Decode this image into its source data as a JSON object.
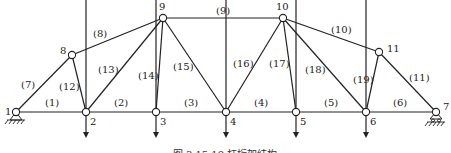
{
  "figure": {
    "caption": "图 3.15   19 杆桁架结构",
    "nodes": [
      {
        "id": "1",
        "x": 16,
        "y": 112,
        "lx": 5,
        "ly": 115
      },
      {
        "id": "2",
        "x": 86,
        "y": 112,
        "lx": 90,
        "ly": 125
      },
      {
        "id": "3",
        "x": 156,
        "y": 112,
        "lx": 160,
        "ly": 125
      },
      {
        "id": "4",
        "x": 226,
        "y": 112,
        "lx": 230,
        "ly": 125
      },
      {
        "id": "5",
        "x": 296,
        "y": 112,
        "lx": 300,
        "ly": 125
      },
      {
        "id": "6",
        "x": 366,
        "y": 112,
        "lx": 370,
        "ly": 125
      },
      {
        "id": "7",
        "x": 436,
        "y": 112,
        "lx": 443,
        "ly": 110
      },
      {
        "id": "8",
        "x": 72,
        "y": 55,
        "lx": 60,
        "ly": 54
      },
      {
        "id": "9",
        "x": 163,
        "y": 18,
        "lx": 159,
        "ly": 10
      },
      {
        "id": "10",
        "x": 283,
        "y": 18,
        "lx": 276,
        "ly": 10
      },
      {
        "id": "11",
        "x": 379,
        "y": 52,
        "lx": 387,
        "ly": 52
      }
    ],
    "members": [
      {
        "id": "(1)",
        "a": "1",
        "b": "2",
        "lx": 45,
        "ly": 106
      },
      {
        "id": "(2)",
        "a": "2",
        "b": "3",
        "lx": 114,
        "ly": 106
      },
      {
        "id": "(3)",
        "a": "3",
        "b": "4",
        "lx": 184,
        "ly": 106
      },
      {
        "id": "(4)",
        "a": "4",
        "b": "5",
        "lx": 254,
        "ly": 106
      },
      {
        "id": "(5)",
        "a": "5",
        "b": "6",
        "lx": 324,
        "ly": 106
      },
      {
        "id": "(6)",
        "a": "6",
        "b": "7",
        "lx": 393,
        "ly": 106
      },
      {
        "id": "(7)",
        "a": "1",
        "b": "8",
        "lx": 21,
        "ly": 88
      },
      {
        "id": "(8)",
        "a": "8",
        "b": "9",
        "lx": 93,
        "ly": 37
      },
      {
        "id": "(9)",
        "a": "9",
        "b": "10",
        "lx": 216,
        "ly": 14
      },
      {
        "id": "(10)",
        "a": "10",
        "b": "11",
        "lx": 331,
        "ly": 33
      },
      {
        "id": "(11)",
        "a": "11",
        "b": "7",
        "lx": 409,
        "ly": 81
      },
      {
        "id": "(12)",
        "a": "8",
        "b": "2",
        "lx": 59,
        "ly": 90
      },
      {
        "id": "(13)",
        "a": "9",
        "b": "2",
        "lx": 98,
        "ly": 73
      },
      {
        "id": "(14)",
        "a": "9",
        "b": "3",
        "lx": 138,
        "ly": 79
      },
      {
        "id": "(15)",
        "a": "9",
        "b": "4",
        "lx": 173,
        "ly": 70
      },
      {
        "id": "(16)",
        "a": "10",
        "b": "4",
        "lx": 233,
        "ly": 67
      },
      {
        "id": "(17)",
        "a": "10",
        "b": "5",
        "lx": 269,
        "ly": 67
      },
      {
        "id": "(18)",
        "a": "10",
        "b": "6",
        "lx": 305,
        "ly": 73
      },
      {
        "id": "(19)",
        "a": "6",
        "b": "11",
        "lx": 353,
        "ly": 83
      }
    ],
    "loads": [
      {
        "node": "2",
        "x": 86,
        "y1": 114,
        "y2": 138
      },
      {
        "node": "3",
        "x": 156,
        "y1": 114,
        "y2": 138
      },
      {
        "node": "4",
        "x": 226,
        "y1": 114,
        "y2": 138
      },
      {
        "node": "5",
        "x": 296,
        "y1": 114,
        "y2": 138
      },
      {
        "node": "6",
        "x": 366,
        "y1": 114,
        "y2": 138
      }
    ],
    "supports": [
      {
        "node": "1",
        "type": "pin",
        "x": 16,
        "y": 112
      },
      {
        "node": "7",
        "type": "roller",
        "x": 436,
        "y": 112
      }
    ]
  }
}
